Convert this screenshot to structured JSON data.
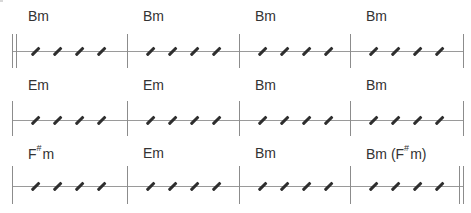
{
  "colors": {
    "staff_line": "#9a9a9a",
    "barline": "#8c8c8c",
    "slash": "#2e2e2e",
    "chord_text": "#333333"
  },
  "rows": [
    {
      "staff_y": 51,
      "bar_top": 34,
      "bar_bottom": 68,
      "chord_y": 8,
      "start_double": true,
      "end_double": false,
      "measures": [
        {
          "chord": "Bm",
          "root": "Bm",
          "sharp": "",
          "suffix": "",
          "beats": 4
        },
        {
          "chord": "Bm",
          "root": "Bm",
          "sharp": "",
          "suffix": "",
          "beats": 4
        },
        {
          "chord": "Bm",
          "root": "Bm",
          "sharp": "",
          "suffix": "",
          "beats": 4
        },
        {
          "chord": "Bm",
          "root": "Bm",
          "sharp": "",
          "suffix": "",
          "beats": 4
        }
      ]
    },
    {
      "staff_y": 120,
      "bar_top": 101,
      "bar_bottom": 136,
      "chord_y": 77,
      "start_double": false,
      "end_double": false,
      "measures": [
        {
          "chord": "Em",
          "root": "Em",
          "sharp": "",
          "suffix": "",
          "beats": 4
        },
        {
          "chord": "Em",
          "root": "Em",
          "sharp": "",
          "suffix": "",
          "beats": 4
        },
        {
          "chord": "Bm",
          "root": "Bm",
          "sharp": "",
          "suffix": "",
          "beats": 4
        },
        {
          "chord": "Bm",
          "root": "Bm",
          "sharp": "",
          "suffix": "",
          "beats": 4
        }
      ]
    },
    {
      "staff_y": 186,
      "bar_top": 166,
      "bar_bottom": 204,
      "chord_y": 145,
      "start_double": false,
      "end_double": true,
      "measures": [
        {
          "chord": "F#m",
          "root": "F",
          "sharp": "#",
          "suffix": "m",
          "beats": 4
        },
        {
          "chord": "Em",
          "root": "Em",
          "sharp": "",
          "suffix": "",
          "beats": 4
        },
        {
          "chord": "Bm",
          "root": "Bm",
          "sharp": "",
          "suffix": "",
          "beats": 4
        },
        {
          "chord": "Bm (F#m)",
          "root": "Bm (F",
          "sharp": "#",
          "suffix": "m)",
          "beats": 4
        }
      ]
    }
  ],
  "layout": {
    "barline_x": [
      12,
      127,
      239,
      350,
      463
    ],
    "slash_offsets": [
      23,
      45,
      67,
      89
    ],
    "chord_offset": 16
  }
}
